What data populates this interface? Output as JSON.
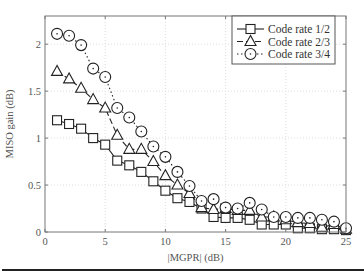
{
  "chart_data": {
    "type": "line",
    "title": "",
    "xlabel": "|MGPR| (dB)",
    "ylabel": "MISO gain (dB)",
    "xlim": [
      0,
      25
    ],
    "ylim": [
      0,
      2.3
    ],
    "xticks": [
      0,
      5,
      10,
      15,
      20,
      25
    ],
    "yticks": [
      0,
      0.5,
      1,
      1.5,
      2
    ],
    "xtick_labels": [
      "0",
      "5",
      "10",
      "15",
      "20",
      "25"
    ],
    "ytick_labels": [
      "0",
      "0.5",
      "1",
      "1.5",
      "2"
    ],
    "grid": true,
    "legend_position": "upper right",
    "x": [
      1,
      2,
      3,
      4,
      5,
      6,
      7,
      8,
      9,
      10,
      11,
      12,
      13,
      14,
      15,
      16,
      17,
      18,
      19,
      20,
      21,
      22,
      23,
      24,
      25
    ],
    "series": [
      {
        "name": "Code rate 1/2",
        "marker": "square",
        "linestyle": "solid",
        "values": [
          1.19,
          1.15,
          1.1,
          1.0,
          0.93,
          0.76,
          0.71,
          0.64,
          0.54,
          0.44,
          0.36,
          0.32,
          0.25,
          0.16,
          0.15,
          0.15,
          0.13,
          0.08,
          0.08,
          0.08,
          0.04,
          0.04,
          0.03,
          0.03,
          0.02
        ]
      },
      {
        "name": "Code rate 2/3",
        "marker": "triangle",
        "linestyle": "dashed",
        "values": [
          1.71,
          1.63,
          1.53,
          1.41,
          1.32,
          1.03,
          0.88,
          0.88,
          0.75,
          0.6,
          0.5,
          0.41,
          0.26,
          0.24,
          0.25,
          0.23,
          0.23,
          0.16,
          0.16,
          0.13,
          0.1,
          0.09,
          0.05,
          0.08,
          0.03
        ]
      },
      {
        "name": "Code rate 3/4",
        "marker": "circle",
        "linestyle": "dotted",
        "values": [
          2.11,
          2.09,
          1.99,
          1.74,
          1.65,
          1.32,
          1.22,
          1.07,
          0.91,
          0.8,
          0.64,
          0.49,
          0.33,
          0.35,
          0.26,
          0.25,
          0.31,
          0.24,
          0.16,
          0.16,
          0.15,
          0.15,
          0.13,
          0.11,
          0.04
        ]
      }
    ]
  },
  "colors": {
    "line": "#222222",
    "axis": "#777777",
    "grid": "#dddddd",
    "rule": "#222222"
  }
}
